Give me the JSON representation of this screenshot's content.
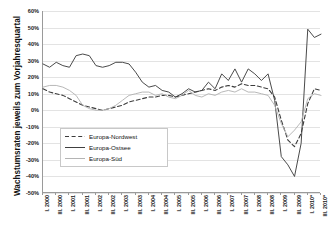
{
  "chart_data": {
    "type": "line",
    "title": "",
    "subtitle": "",
    "xlabel": "",
    "ylabel": "Wachstumsraten jeweils zum Vorjahresquartal",
    "ylim": [
      -50,
      60
    ],
    "ytick_step": 10,
    "grid": true,
    "legend_position": "inside-lower-left",
    "y_ticks": [
      "60%",
      "50%",
      "40%",
      "30%",
      "20%",
      "10%",
      "0%",
      "-10%",
      "-20%",
      "-30%",
      "-40%",
      "-50%"
    ],
    "y_tick_values": [
      60,
      50,
      40,
      30,
      20,
      10,
      0,
      -10,
      -20,
      -30,
      -40,
      -50
    ],
    "categories": [
      "I. 2000",
      "II. 2000",
      "III. 2000",
      "IV. 2000",
      "I. 2001",
      "II. 2001",
      "III. 2001",
      "IV. 2001",
      "I. 2002",
      "II. 2002",
      "III. 2002",
      "IV. 2002",
      "I. 2003",
      "II. 2003",
      "III. 2003",
      "IV. 2003",
      "I. 2004",
      "II. 2004",
      "III. 2004",
      "IV. 2004",
      "I. 2005",
      "II. 2005",
      "III. 2005",
      "IV. 2005",
      "I. 2006",
      "II. 2006",
      "III. 2006",
      "IV. 2006",
      "I. 2007",
      "II. 2007",
      "III. 2007",
      "IV. 2007",
      "I. 2008",
      "II. 2008",
      "III. 2008",
      "IV. 2008",
      "I. 2009",
      "II. 2009",
      "III. 2009",
      "IV. 2009",
      "I. 2010*",
      "II. 2010*",
      "III. 2010*"
    ],
    "x_tick_labels": [
      "I. 2000",
      "III. 2000",
      "I. 2001",
      "III. 2001",
      "I. 2002",
      "III. 2002",
      "I. 2003",
      "III. 2003",
      "I. 2004",
      "III. 2004",
      "I. 2005",
      "III. 2005",
      "I. 2006",
      "III. 2006",
      "I. 2007",
      "III. 2007",
      "I. 2008",
      "III. 2008",
      "I. 2009",
      "III. 2009",
      "I. 2010*",
      "III. 2010*"
    ],
    "x_tick_indices": [
      0,
      2,
      4,
      6,
      8,
      10,
      12,
      14,
      16,
      18,
      20,
      22,
      24,
      26,
      28,
      30,
      32,
      34,
      36,
      38,
      40,
      42
    ],
    "series": [
      {
        "name": "Europa-Nordwest",
        "style": "dashed",
        "color": "#3c3c3c",
        "values": [
          13,
          11,
          10,
          9,
          7,
          5,
          3,
          2,
          1,
          0,
          1,
          2,
          3,
          5,
          6,
          7,
          8,
          8,
          9,
          9,
          8,
          9,
          10,
          11,
          12,
          13,
          12,
          14,
          15,
          14,
          16,
          15,
          15,
          14,
          13,
          8,
          -6,
          -18,
          -22,
          -14,
          4,
          13,
          12
        ]
      },
      {
        "name": "Europa-Ostsee",
        "style": "solid",
        "color": "#404040",
        "values": [
          28,
          26,
          29,
          27,
          26,
          33,
          34,
          33,
          27,
          26,
          27,
          29,
          29,
          28,
          23,
          17,
          14,
          15,
          12,
          11,
          8,
          10,
          13,
          11,
          12,
          17,
          13,
          22,
          18,
          25,
          17,
          25,
          22,
          18,
          22,
          6,
          -28,
          -33,
          -40,
          -20,
          49,
          44,
          46
        ]
      },
      {
        "name": "Europa-Süd",
        "style": "solid",
        "color": "#b4b4b4",
        "values": [
          14,
          15,
          15,
          14,
          12,
          9,
          3,
          1,
          0,
          0,
          1,
          3,
          6,
          9,
          10,
          11,
          11,
          9,
          10,
          8,
          7,
          9,
          12,
          9,
          8,
          10,
          9,
          11,
          12,
          11,
          13,
          11,
          11,
          10,
          9,
          3,
          -8,
          -16,
          -12,
          -7,
          7,
          10,
          9
        ]
      }
    ]
  },
  "legend": {
    "items": [
      {
        "label": "Europa-Nordwest",
        "swatch": "dashed-line-swatch"
      },
      {
        "label": "Europa-Ostsee",
        "swatch": "solid-dark-line-swatch"
      },
      {
        "label": "Europa-Süd",
        "swatch": "solid-gray-line-swatch"
      }
    ]
  },
  "colors": {
    "nordwest": "#3c3c3c",
    "ostsee": "#404040",
    "sued": "#b4b4b4",
    "grid": "#e3e3e3",
    "axis": "#9a9a9a"
  }
}
